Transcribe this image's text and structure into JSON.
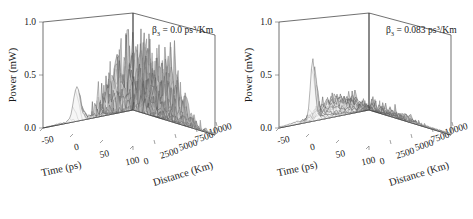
{
  "figure": {
    "type": "scientific-figure",
    "background": "#ffffff",
    "panel_count": 2
  },
  "panels": [
    {
      "id": "left",
      "annotation": {
        "symbol": "β",
        "subscript": "3",
        "equals": " = ",
        "value": "0.0",
        "unit_base": " ps",
        "unit_sup": "3",
        "unit_tail": "/Km",
        "full_text": "β₃ = 0.0 ps³/Km"
      },
      "axes": {
        "z": {
          "label": "Power (mW)",
          "ticks": [
            "1.0",
            "0.5",
            "0.0"
          ],
          "range": [
            0.0,
            1.0
          ]
        },
        "x": {
          "label": "Time (ps)",
          "ticks": [
            "-50",
            "0",
            "50",
            "100"
          ],
          "range": [
            -75,
            125
          ]
        },
        "y": {
          "label": "Distance (Km)",
          "ticks": [
            "0",
            "2500",
            "5000",
            "7500",
            "10000"
          ],
          "range": [
            0,
            10000
          ]
        }
      }
    },
    {
      "id": "right",
      "annotation": {
        "symbol": "β",
        "subscript": "3",
        "equals": " = ",
        "value": "0.083",
        "unit_base": " ps",
        "unit_sup": "3",
        "unit_tail": "/Km",
        "full_text": "β₃ = 0.083 ps³/Km"
      },
      "axes": {
        "z": {
          "label": "Power (mW)",
          "ticks": [
            "1.0",
            "0.5",
            "0.0"
          ],
          "range": [
            0.0,
            1.0
          ]
        },
        "x": {
          "label": "Time (ps)",
          "ticks": [
            "-50",
            "0",
            "50",
            "100"
          ],
          "range": [
            -75,
            125
          ]
        },
        "y": {
          "label": "Distance (Km)",
          "ticks": [
            "0",
            "2500",
            "5000",
            "7500",
            "10000"
          ],
          "range": [
            0,
            10000
          ]
        }
      }
    }
  ],
  "chart_data": [
    {
      "type": "surface",
      "title": "β₃ = 0.0 ps³/Km",
      "xlabel": "Time (ps)",
      "ylabel": "Distance (Km)",
      "zlabel": "Power (mW)",
      "xlim": [
        -75,
        125
      ],
      "ylim": [
        0,
        10000
      ],
      "zlim": [
        0.0,
        1.0
      ],
      "xticks": [
        -50,
        0,
        50,
        100
      ],
      "yticks": [
        0,
        2500,
        5000,
        7500,
        10000
      ],
      "zticks": [
        0.0,
        0.5,
        1.0
      ],
      "grid": false,
      "legend": "none",
      "description": "Chaotic pulse breakup: dense forest of tall narrow spikes reaching peak power near 0.8 mW, concentrated around time 0 to 50 ps, growing after roughly 2500 Km and persisting to 10000 Km.",
      "surface_peak_power": 0.8,
      "surface_mean_power": 0.25,
      "onset_distance_km": 2000,
      "spike_count": 46,
      "time_center_ps": 20,
      "time_spread_ps": 55
    },
    {
      "type": "surface",
      "title": "β₃ = 0.083 ps³/Km",
      "xlabel": "Time (ps)",
      "ylabel": "Distance (Km)",
      "zlabel": "Power (mW)",
      "xlim": [
        -75,
        125
      ],
      "ylim": [
        0,
        10000
      ],
      "zlim": [
        0.0,
        1.0
      ],
      "xticks": [
        -50,
        0,
        50,
        100
      ],
      "yticks": [
        0,
        2500,
        5000,
        7500,
        10000
      ],
      "zticks": [
        0.0,
        0.5,
        1.0
      ],
      "grid": false,
      "legend": "none",
      "description": "Suppressed breakup with third-order dispersion: a single tall initial soliton peak near 0.55 mW at small distance, decaying into a low-amplitude rough plateau around 0.2 mW that spreads in time toward 10000 Km.",
      "surface_peak_power": 0.55,
      "surface_mean_power": 0.18,
      "onset_distance_km": 500,
      "spike_count": 40,
      "time_center_ps": 10,
      "time_spread_ps": 70
    }
  ]
}
